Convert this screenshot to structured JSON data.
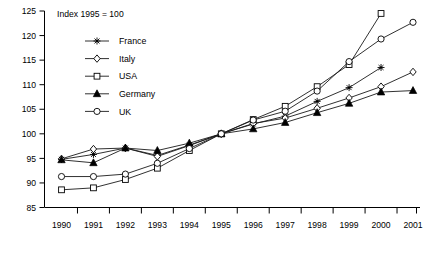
{
  "chart_data": {
    "type": "line",
    "title": "Index 1995 = 100",
    "xlabel": "",
    "ylabel": "",
    "grid": false,
    "legend_position": "inside-top-left",
    "xlim": [
      1990,
      2001
    ],
    "ylim": [
      85,
      125
    ],
    "ytick_step": 5,
    "categories": [
      "1990",
      "1991",
      "1992",
      "1993",
      "1994",
      "1995",
      "1996",
      "1997",
      "1998",
      "1999",
      "2000",
      "2001"
    ],
    "yticks": [
      "85",
      "90",
      "95",
      "100",
      "105",
      "110",
      "115",
      "120",
      "125"
    ],
    "series": [
      {
        "name": "France",
        "marker": "asterisk",
        "values": [
          94.8,
          95.8,
          97.1,
          95.6,
          97.7,
          100.0,
          102.0,
          103.6,
          106.6,
          109.4,
          113.5,
          null
        ]
      },
      {
        "name": "Italy",
        "marker": "open-diamond",
        "values": [
          94.9,
          96.9,
          97.1,
          95.4,
          97.6,
          100.0,
          102.1,
          103.2,
          105.2,
          107.3,
          109.6,
          112.6
        ]
      },
      {
        "name": "USA",
        "marker": "open-square",
        "values": [
          88.6,
          89.0,
          90.7,
          93.0,
          96.6,
          100.0,
          102.9,
          105.6,
          109.6,
          114.1,
          124.5,
          null
        ]
      },
      {
        "name": "Germany",
        "marker": "filled-triangle",
        "values": [
          94.7,
          94.1,
          97.1,
          96.6,
          98.1,
          100.0,
          101.0,
          102.3,
          104.3,
          106.2,
          108.5,
          108.8
        ]
      },
      {
        "name": "UK",
        "marker": "open-circle",
        "values": [
          91.3,
          91.3,
          91.8,
          94.0,
          97.0,
          100.0,
          102.8,
          104.6,
          108.7,
          114.7,
          119.3,
          122.7
        ]
      }
    ]
  }
}
